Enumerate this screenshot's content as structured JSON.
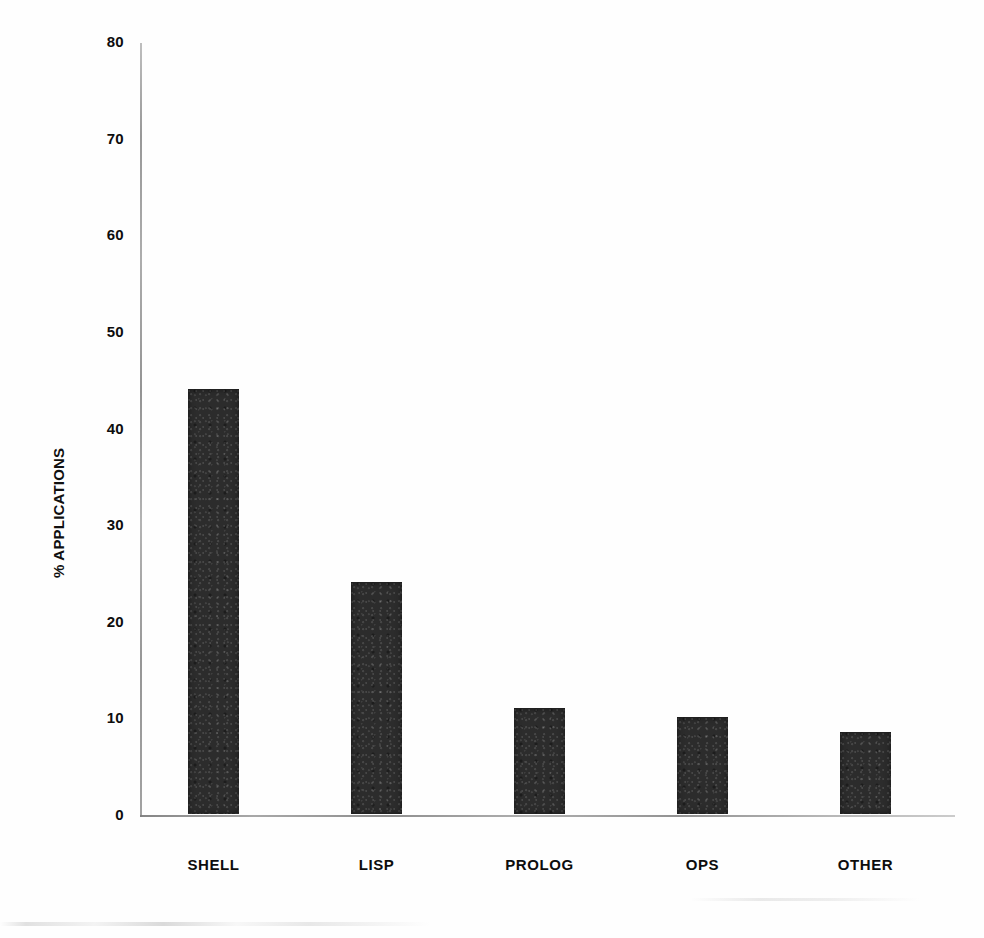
{
  "chart_data": {
    "type": "bar",
    "title": "",
    "subtitle": "",
    "xlabel": "",
    "ylabel": "% APPLICATIONS",
    "categories": [
      "SHELL",
      "LISP",
      "PROLOG",
      "OPS",
      "OTHER"
    ],
    "values": [
      44,
      24,
      11,
      10,
      8.5
    ],
    "ylim": [
      0,
      80
    ],
    "yticks": [
      0,
      10,
      20,
      30,
      40,
      50,
      60,
      70,
      80
    ],
    "ytick_labels": [
      "0",
      "10",
      "20",
      "30",
      "40",
      "50",
      "60",
      "70",
      "80"
    ],
    "grid": false,
    "legend": null,
    "legend_position": "none",
    "bar_color": "#2c2c2c",
    "axis_color": "#999999",
    "background_color": "#ffffff",
    "text_color": "#0d0d0d",
    "series": [
      {
        "name": "% APPLICATIONS",
        "values": [
          44,
          24,
          11,
          10,
          8.5
        ]
      }
    ]
  }
}
